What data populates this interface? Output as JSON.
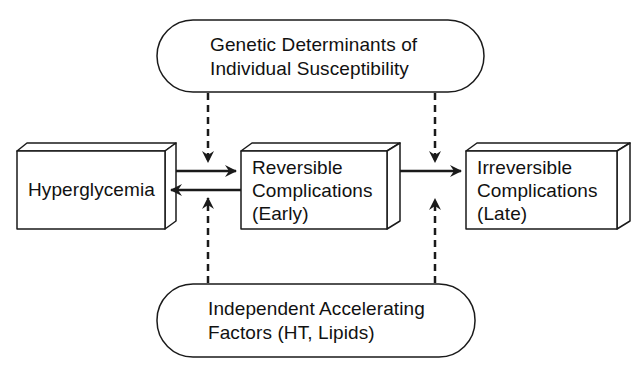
{
  "diagram": {
    "type": "flow",
    "colors": {
      "stroke": "#1a1a1a",
      "fill": "#ffffff",
      "text": "#111111"
    },
    "nodes": {
      "genetic": {
        "shape": "rounded-pill",
        "line1": "Genetic  Determinants  of",
        "line2": "Individual  Susceptibility"
      },
      "hyperglycemia": {
        "shape": "3d-box",
        "label": "Hyperglycemia"
      },
      "reversible": {
        "shape": "3d-box",
        "line1": "Reversible",
        "line2": "Complications",
        "line3": "(Early)"
      },
      "irreversible": {
        "shape": "3d-box",
        "line1": "Irreversible",
        "line2": "Complications",
        "line3": "(Late)"
      },
      "accelerating": {
        "shape": "rounded-pill",
        "line1": "Independent  Accelerating",
        "line2": "Factors  (HT,  Lipids)"
      }
    },
    "edges": [
      {
        "from": "hyperglycemia",
        "to": "reversible",
        "style": "solid"
      },
      {
        "from": "reversible",
        "to": "hyperglycemia",
        "style": "solid"
      },
      {
        "from": "reversible",
        "to": "irreversible",
        "style": "solid"
      },
      {
        "from": "genetic",
        "to": "hyperglycemia->reversible",
        "style": "dashed"
      },
      {
        "from": "genetic",
        "to": "reversible->irreversible",
        "style": "dashed"
      },
      {
        "from": "accelerating",
        "to": "reversible->hyperglycemia",
        "style": "dashed"
      },
      {
        "from": "accelerating",
        "to": "reversible->irreversible",
        "style": "dashed"
      }
    ]
  }
}
